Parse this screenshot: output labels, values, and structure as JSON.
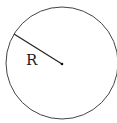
{
  "diagram": {
    "shape": "circle",
    "radius_label": "R",
    "stroke_color": "#333333",
    "center_dot": true
  }
}
